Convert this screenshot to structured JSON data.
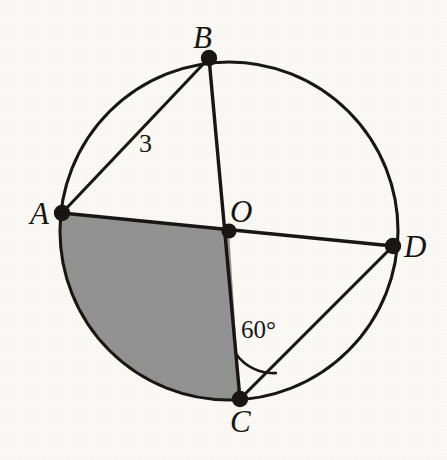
{
  "figure": {
    "type": "circle-geometry-diagram",
    "background_color": "#fbfaf6",
    "stroke_color": "#171412",
    "shaded_fill_color": "#929292",
    "circle": {
      "center_label": "O",
      "center_x": 229,
      "center_y": 231,
      "radius": 169
    },
    "points": [
      {
        "label": "A",
        "x": 62,
        "y": 213,
        "angle_deg": 186
      },
      {
        "label": "B",
        "x": 209,
        "y": 58,
        "angle_deg": 97
      },
      {
        "label": "C",
        "x": 240,
        "y": 399,
        "angle_deg": -86
      },
      {
        "label": "D",
        "x": 393,
        "y": 246,
        "angle_deg": -5
      }
    ],
    "segments": [
      {
        "name": "segment-A-B",
        "from": "A",
        "to": "B",
        "kind": "chord"
      },
      {
        "name": "segment-B-O-C",
        "from": "B",
        "to": "C",
        "kind": "diameter"
      },
      {
        "name": "segment-A-O-D",
        "from": "A",
        "to": "D",
        "kind": "diameter"
      },
      {
        "name": "segment-C-D",
        "from": "C",
        "to": "D",
        "kind": "chord"
      }
    ],
    "shaded_region": {
      "name": "sector-A-O-C",
      "vertices": [
        "A",
        "O",
        "C"
      ],
      "description": "shaded circular sector bounded by radius OA, arc AC, and radius OC"
    },
    "labels": {
      "point_a": "A",
      "point_b": "B",
      "point_c": "C",
      "point_d": "D",
      "center": "O",
      "chord_ab_length": "3",
      "angle_at_c": "60°"
    },
    "angle_marker": {
      "name": "angle-arc-at-C",
      "vertex": "C",
      "value": "60°",
      "between": [
        "C-O",
        "C-D"
      ]
    }
  }
}
